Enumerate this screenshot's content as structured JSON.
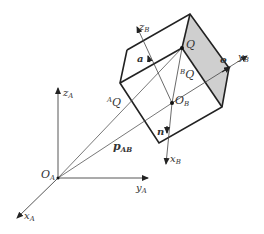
{
  "diagram": {
    "colors": {
      "line": "#222222",
      "thin": "#555555",
      "shade": "#cfcfcf",
      "text": "#333333"
    },
    "frame_A": {
      "origin": "O",
      "origin_sub": "A",
      "x_axis": "x",
      "x_sub": "A",
      "y_axis": "y",
      "y_sub": "A",
      "z_axis": "z",
      "z_sub": "A"
    },
    "frame_B": {
      "origin": "O",
      "origin_sub": "B",
      "x_axis": "x",
      "x_sub": "B",
      "y_axis": "y",
      "y_sub": "B",
      "z_axis": "z",
      "z_sub": "B"
    },
    "vectors": {
      "a": "a",
      "o": "o",
      "n": "n",
      "p": "p",
      "p_sub": "AB",
      "AQ_sup": "A",
      "AQ": "Q",
      "BQ_sup": "B",
      "BQ": "Q",
      "Q": "Q"
    }
  }
}
